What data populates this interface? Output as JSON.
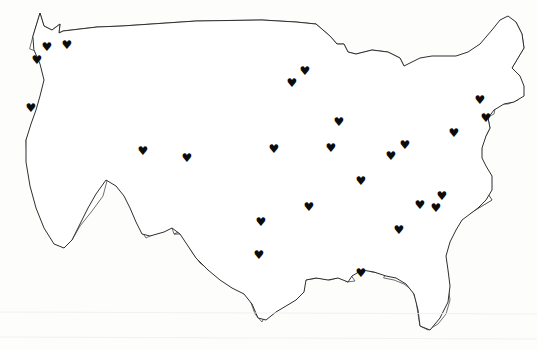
{
  "map": {
    "title": "United States Heart Marker Map",
    "region": "Contiguous United States",
    "projection_note": "48 contiguous states outline",
    "background_color": "#fdfdfc",
    "state_border_color": "#4a4a4a",
    "outline_color": "#2e2e2e",
    "marker_color": "#0b0b0b",
    "marker_glyph": "♥",
    "marker_icon_name": "heart-icon",
    "marker_count": 24
  },
  "markers": [
    {
      "id": "marker-01",
      "label": "",
      "state": "Washington",
      "x": 47,
      "y": 47
    },
    {
      "id": "marker-02",
      "label": "",
      "state": "Washington",
      "x": 67,
      "y": 45
    },
    {
      "id": "marker-03",
      "label": "",
      "state": "Oregon",
      "x": 37,
      "y": 60
    },
    {
      "id": "marker-04",
      "label": "",
      "state": "California",
      "x": 31,
      "y": 108
    },
    {
      "id": "marker-05",
      "label": "",
      "state": "Utah",
      "x": 143,
      "y": 151
    },
    {
      "id": "marker-06",
      "label": "",
      "state": "Colorado",
      "x": 187,
      "y": 158
    },
    {
      "id": "marker-07",
      "label": "",
      "state": "Minnesota",
      "x": 305,
      "y": 71
    },
    {
      "id": "marker-08",
      "label": "",
      "state": "Minnesota",
      "x": 292,
      "y": 83
    },
    {
      "id": "marker-09",
      "label": "",
      "state": "Wisconsin",
      "x": 339,
      "y": 122
    },
    {
      "id": "marker-10",
      "label": "",
      "state": "Iowa",
      "x": 274,
      "y": 149
    },
    {
      "id": "marker-11",
      "label": "",
      "state": "Illinois",
      "x": 331,
      "y": 148
    },
    {
      "id": "marker-12",
      "label": "",
      "state": "Indiana",
      "x": 391,
      "y": 156
    },
    {
      "id": "marker-13",
      "label": "",
      "state": "Ohio",
      "x": 405,
      "y": 145
    },
    {
      "id": "marker-14",
      "label": "",
      "state": "Kentucky",
      "x": 361,
      "y": 181
    },
    {
      "id": "marker-15",
      "label": "",
      "state": "Missouri",
      "x": 309,
      "y": 207
    },
    {
      "id": "marker-16",
      "label": "",
      "state": "Pennsylvania",
      "x": 454,
      "y": 133
    },
    {
      "id": "marker-17",
      "label": "",
      "state": "New York",
      "x": 480,
      "y": 100
    },
    {
      "id": "marker-18",
      "label": "",
      "state": "Connecticut",
      "x": 486,
      "y": 118
    },
    {
      "id": "marker-19",
      "label": "",
      "state": "Tennessee",
      "x": 420,
      "y": 205
    },
    {
      "id": "marker-20",
      "label": "",
      "state": "North Carolina",
      "x": 442,
      "y": 196
    },
    {
      "id": "marker-21",
      "label": "",
      "state": "South Carolina",
      "x": 436,
      "y": 208
    },
    {
      "id": "marker-22",
      "label": "",
      "state": "Oklahoma",
      "x": 261,
      "y": 222
    },
    {
      "id": "marker-23",
      "label": "",
      "state": "Texas",
      "x": 259,
      "y": 255
    },
    {
      "id": "marker-24",
      "label": "",
      "state": "Georgia",
      "x": 399,
      "y": 230
    },
    {
      "id": "marker-25",
      "label": "",
      "state": "Louisiana",
      "x": 361,
      "y": 273
    }
  ]
}
